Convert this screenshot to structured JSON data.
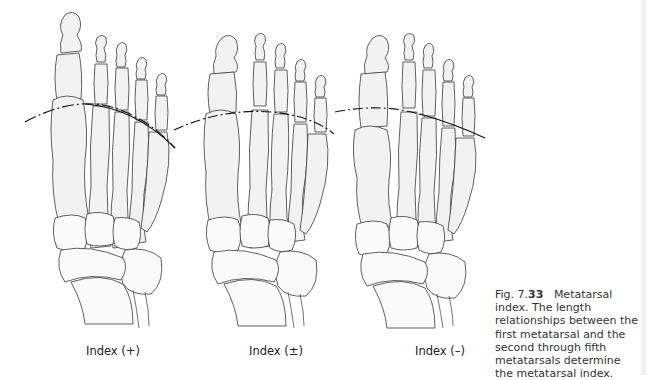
{
  "figure": {
    "panels": [
      {
        "id": "plus",
        "label": "Index (+)",
        "line_style": "solid-curve"
      },
      {
        "id": "plusminus",
        "label": "Index (±)",
        "line_style": "dash-dot-curve"
      },
      {
        "id": "minus",
        "label": "Index (–)",
        "line_style": "dash-dot-curve"
      }
    ],
    "caption": {
      "prefix": "Fig. 7.",
      "number": "33",
      "title": "Metatarsal index.",
      "body": "The length relationships between the first metatarsal and the second through fifth metatarsals determine the metatarsal index."
    }
  },
  "colors": {
    "bone_fill": "#f2f2f2",
    "outline": "#3a3a3a",
    "index_line": "#111111",
    "text": "#333333"
  }
}
